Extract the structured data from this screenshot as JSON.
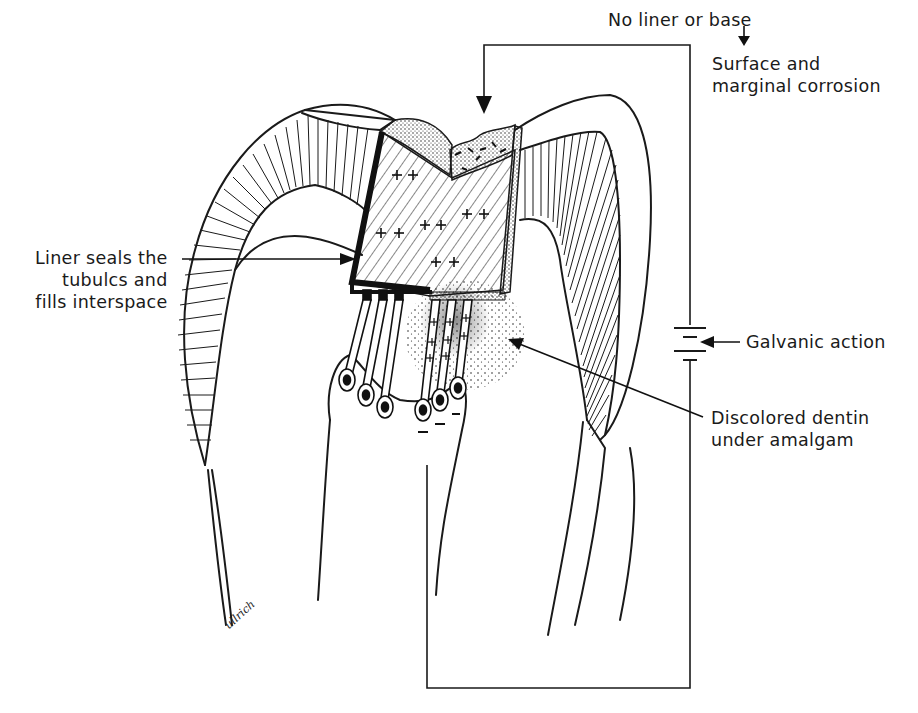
{
  "figure": {
    "type": "dental cross-section illustration",
    "colors": {
      "ink": "#1a1a1a",
      "background": "#ffffff"
    }
  },
  "labels": {
    "no_liner": "No liner or base",
    "corrosion": "Surface and\nmarginal corrosion",
    "liner": "Liner seals the\ntubulcs and\nfills interspace",
    "galvanic": "Galvanic action",
    "discolored": "Discolored dentin\nunder amalgam"
  },
  "symbols": {
    "positive_charge": "+",
    "negative_charge": "–",
    "battery": "battery-cell-icon"
  },
  "signature": "ullrich"
}
